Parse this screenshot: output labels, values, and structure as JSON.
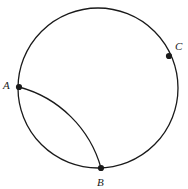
{
  "figure": {
    "background_color": "#ffffff",
    "stroke_color": "#1a1a1a",
    "point_color": "#1a1a1a",
    "labels": {
      "A": "A",
      "B": "B",
      "C": "C"
    }
  },
  "chart_data": {
    "type": "diagram",
    "title": "",
    "xlabel": "",
    "ylabel": "",
    "shapes": [
      {
        "name": "main-circle",
        "kind": "circle",
        "center": [
          98,
          88
        ],
        "radius": 80,
        "stroke": "#1a1a1a",
        "stroke_width": 1.3,
        "fill": "none"
      },
      {
        "name": "inner-arc-AB",
        "kind": "arc",
        "from": [
          19,
          87
        ],
        "to": [
          101,
          168
        ],
        "radius": 116,
        "sweep": 1,
        "large_arc": 0,
        "stroke": "#1a1a1a",
        "stroke_width": 1.3,
        "fill": "none"
      }
    ],
    "points": [
      {
        "name": "A",
        "label": "A",
        "x": 19,
        "y": 87,
        "label_x": 3,
        "label_y": 80,
        "marker": "dot",
        "size": 3.1
      },
      {
        "name": "B",
        "label": "B",
        "x": 101,
        "y": 168,
        "label_x": 97,
        "label_y": 177,
        "marker": "dot",
        "size": 3.1
      },
      {
        "name": "C",
        "label": "C",
        "x": 169,
        "y": 56,
        "label_x": 175,
        "label_y": 41,
        "marker": "dot",
        "size": 3.1
      }
    ],
    "grid": false,
    "legend": false
  }
}
